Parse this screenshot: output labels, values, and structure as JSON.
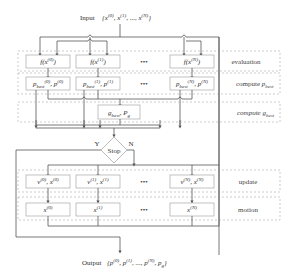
{
  "input": {
    "prefix": "Input",
    "set": "{x(0), x(1), ..., x(N)}"
  },
  "output": {
    "prefix": "Output",
    "set": "{p(0), p(1), ..., p(N), pg}"
  },
  "stages": [
    {
      "id": "evaluation",
      "label": "evaluation",
      "cells": [
        "f(x(0))",
        "f(x(1))",
        "f(x(N))"
      ],
      "ellipsis": "•••"
    },
    {
      "id": "compute-pbest",
      "label": "compute p_best",
      "cells": [
        "p_best(0), p(0)",
        "p_best(1), p(1)",
        "p_best(N), p(N)"
      ],
      "ellipsis": "•••"
    },
    {
      "id": "compute-gbest",
      "label": "compute g_best",
      "cells": [
        "g_best, p_g"
      ]
    },
    {
      "id": "update",
      "label": "update",
      "cells": [
        "v(0), x(0)",
        "v(1), x(1)",
        "v(N), x(N)"
      ],
      "ellipsis": "•••"
    },
    {
      "id": "motion",
      "label": "motion",
      "cells": [
        "x(0)",
        "x(1)",
        "x(N)"
      ],
      "ellipsis": "•••"
    }
  ],
  "decision": {
    "label": "Stop",
    "yes": "Y",
    "no": "N"
  },
  "colors": {
    "line": "#555555",
    "box_border": "#999999",
    "dashed_border": "#aaaaaa",
    "text": "#333333"
  }
}
